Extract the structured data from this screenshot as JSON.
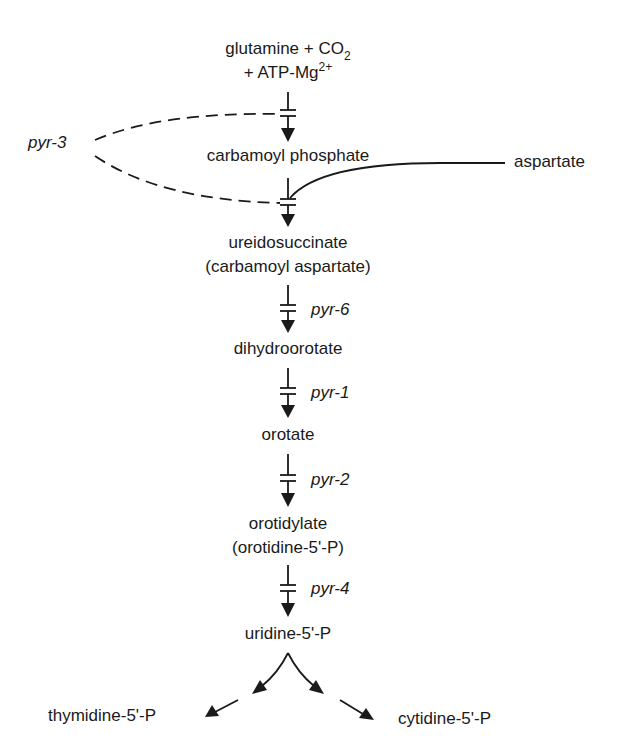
{
  "diagram": {
    "nodes": {
      "start_line1": "glutamine + CO",
      "start_line1_sub": "2",
      "start_line2": "+ ATP-Mg",
      "start_line2_sup": "2+",
      "carbamoyl_phosphate": "carbamoyl phosphate",
      "aspartate": "aspartate",
      "ureidosuccinate": "ureidosuccinate",
      "ureidosuccinate_alt": "(carbamoyl aspartate)",
      "dihydroorotate": "dihydroorotate",
      "orotate": "orotate",
      "orotidylate": "orotidylate",
      "orotidylate_alt": "(orotidine-5'-P)",
      "uridine": "uridine-5'-P",
      "thymidine": "thymidine-5'-P",
      "cytidine": "cytidine-5'-P"
    },
    "genes": {
      "pyr3": "pyr-3",
      "pyr6": "pyr-6",
      "pyr1": "pyr-1",
      "pyr2": "pyr-2",
      "pyr4": "pyr-4"
    },
    "edges": [
      {
        "from": "glutamine + CO2 + ATP-Mg2+",
        "to": "carbamoyl phosphate",
        "gene": "pyr-3",
        "blocked": true
      },
      {
        "from": "carbamoyl phosphate + aspartate",
        "to": "ureidosuccinate",
        "gene": "pyr-3",
        "blocked": true
      },
      {
        "from": "ureidosuccinate",
        "to": "dihydroorotate",
        "gene": "pyr-6",
        "blocked": true
      },
      {
        "from": "dihydroorotate",
        "to": "orotate",
        "gene": "pyr-1",
        "blocked": true
      },
      {
        "from": "orotate",
        "to": "orotidylate",
        "gene": "pyr-2",
        "blocked": true
      },
      {
        "from": "orotidylate",
        "to": "uridine-5'-P",
        "gene": "pyr-4",
        "blocked": true
      },
      {
        "from": "uridine-5'-P",
        "to": "thymidine-5'-P",
        "gene": "",
        "blocked": false
      },
      {
        "from": "uridine-5'-P",
        "to": "cytidine-5'-P",
        "gene": "",
        "blocked": false
      }
    ]
  }
}
